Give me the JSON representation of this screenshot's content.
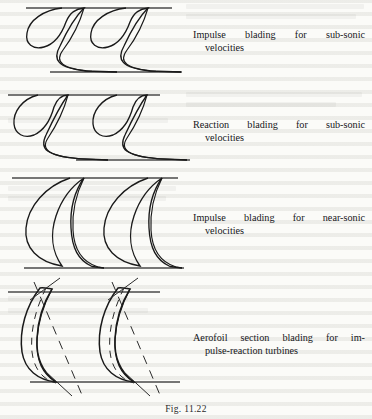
{
  "document": {
    "type": "scanned-textbook-figure",
    "background_color": "#fbfbf8",
    "ink_color": "#1a1a1a",
    "line_color": "#3a3a3a"
  },
  "figure": {
    "caption": "Fig. 11.22",
    "panels": [
      {
        "id": "panel-impulse-subsonic",
        "label_line1": "Impulse  blading  for  sub-sonic",
        "label_line2": "velocities",
        "blade_type": "impulse",
        "regime": "sub-sonic",
        "blade_count": 2,
        "has_camber_lines": false,
        "has_chord_lines": false
      },
      {
        "id": "panel-reaction-subsonic",
        "label_line1": "Reaction  blading  for  sub-sonic",
        "label_line2": "velocities",
        "blade_type": "reaction",
        "regime": "sub-sonic",
        "blade_count": 2,
        "has_camber_lines": false,
        "has_chord_lines": false
      },
      {
        "id": "panel-impulse-nearsonic",
        "label_line1": "Impulse  blading  for  near-sonic",
        "label_line2": "velocities",
        "blade_type": "impulse",
        "regime": "near-sonic",
        "blade_count": 2,
        "has_camber_lines": false,
        "has_chord_lines": false
      },
      {
        "id": "panel-aerofoil-impulse-reaction",
        "label_line1": "Aerofoil  section  blading  for  im-",
        "label_line2": "pulse-reaction turbines",
        "blade_type": "aerofoil section",
        "regime": "impulse-reaction turbines",
        "blade_count": 2,
        "has_camber_lines": true,
        "has_chord_lines": true
      }
    ]
  }
}
